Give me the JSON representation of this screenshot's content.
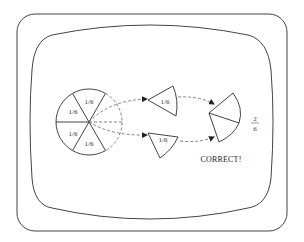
{
  "scene": {
    "description": "CRT monitor screen illustration showing a fractions lesson",
    "colors": {
      "line": "#444444",
      "background": "#ffffff",
      "text": "#222222"
    }
  },
  "pie": {
    "total_slices": 6,
    "present_slices": [
      {
        "position": "top",
        "label": "1/6"
      },
      {
        "position": "upper-left",
        "label": "1/6"
      },
      {
        "position": "lower-left",
        "label": "1/6"
      },
      {
        "position": "bottom",
        "label": "1/6"
      }
    ],
    "missing_slices": 2
  },
  "moved_pieces": [
    {
      "name": "upper-piece",
      "label": "1/6"
    },
    {
      "name": "lower-piece",
      "label": "1/6"
    }
  ],
  "result": {
    "numerator": "2",
    "denominator": "6",
    "message": "CORRECT!"
  }
}
